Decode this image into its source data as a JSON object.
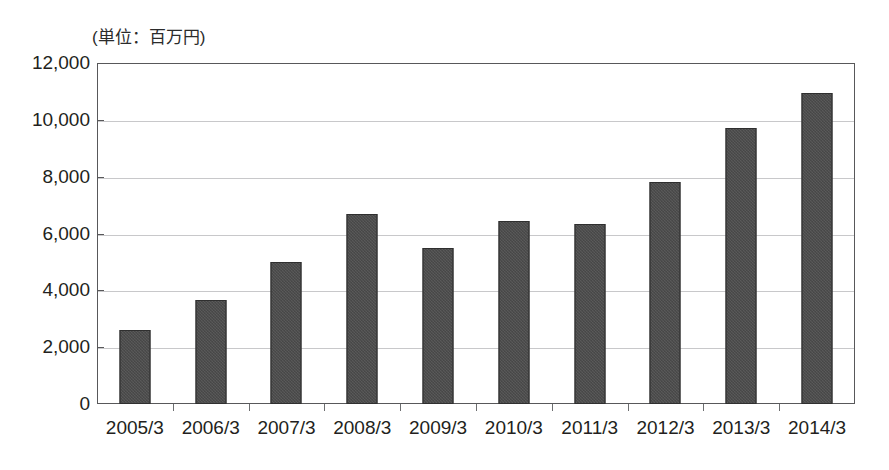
{
  "chart_data": {
    "type": "bar",
    "title": "",
    "subtitle": "",
    "unit_caption": "(単位：百万円)",
    "xlabel": "",
    "ylabel": "",
    "ylim": [
      0,
      12000
    ],
    "ytick_step": 2000,
    "grid": true,
    "legend": "none",
    "bar_color": "#454545",
    "bar_edge_color": "#2f2f2f",
    "grid_color": "#c8c8ca",
    "frame_color": "#58585a",
    "background_color": "#ffffff",
    "categories": [
      "2005/3",
      "2006/3",
      "2007/3",
      "2008/3",
      "2009/3",
      "2010/3",
      "2011/3",
      "2012/3",
      "2013/3",
      "2014/3"
    ],
    "values": [
      2600,
      3650,
      5000,
      6700,
      5500,
      6450,
      6320,
      7800,
      9730,
      10950
    ],
    "ytick_labels": [
      "12,000",
      "10,000",
      "8,000",
      "6,000",
      "4,000",
      "2,000",
      "0"
    ],
    "ytick_values": [
      12000,
      10000,
      8000,
      6000,
      4000,
      2000,
      0
    ]
  }
}
